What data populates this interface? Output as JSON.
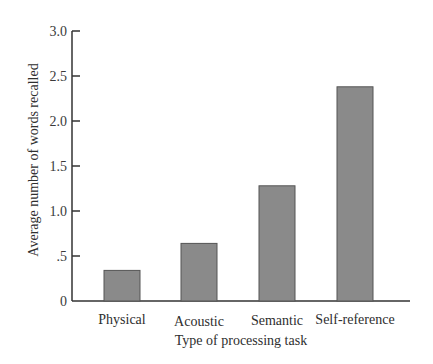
{
  "chart_data": {
    "type": "bar",
    "title": "",
    "xlabel": "Type of processing task",
    "ylabel": "Average number of words recalled",
    "categories": [
      "Physical",
      "Acoustic",
      "Semantic",
      "Self-reference"
    ],
    "values": [
      0.34,
      0.64,
      1.28,
      2.38
    ],
    "ylim": [
      0,
      3.0
    ],
    "yticks": [
      0,
      0.5,
      1.0,
      1.5,
      2.0,
      2.5,
      3.0
    ],
    "ytick_labels": [
      "0",
      ".5",
      "1.0",
      "1.5",
      "2.0",
      "2.5",
      "3.0"
    ],
    "grid": false,
    "legend": null,
    "colors": {
      "bar_fill": "#8a8a8a",
      "bar_stroke": "#555555",
      "axis": "#333333"
    }
  }
}
